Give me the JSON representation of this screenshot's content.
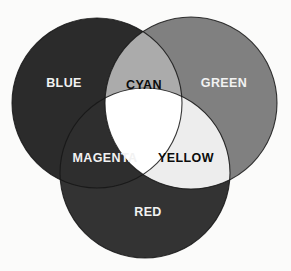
{
  "diagram": {
    "background_color": "#fbfbfa",
    "width": 291,
    "height": 271,
    "type": "venn-3-circle"
  },
  "circles": [
    {
      "id": "blue",
      "label": "BLUE",
      "cx": 97,
      "cy": 103,
      "r": 85,
      "fill": "#2b2b2b",
      "label_x": 64,
      "label_y": 84,
      "label_class": "label-light"
    },
    {
      "id": "green",
      "label": "GREEN",
      "cx": 191,
      "cy": 103,
      "r": 86,
      "fill": "#808080",
      "label_x": 224,
      "label_y": 84,
      "label_class": "label-light"
    },
    {
      "id": "red",
      "label": "RED",
      "cx": 145,
      "cy": 173,
      "r": 85,
      "fill": "#333333",
      "label_x": 148,
      "label_y": 213,
      "label_class": "label-light"
    }
  ],
  "intersections": [
    {
      "id": "cyan",
      "label": "CYAN",
      "parents": [
        "blue",
        "green"
      ],
      "fill": "#ababab",
      "label_x": 144,
      "label_y": 86,
      "label_class": "label-dark"
    },
    {
      "id": "magenta",
      "label": "MAGENTA",
      "parents": [
        "blue",
        "red"
      ],
      "fill": "#2e2e2e",
      "label_x": 105,
      "label_y": 159,
      "label_class": "label-light"
    },
    {
      "id": "yellow",
      "label": "YELLOW",
      "parents": [
        "green",
        "red"
      ],
      "fill": "#ededed",
      "label_x": 186,
      "label_y": 159,
      "label_class": "label-dark"
    }
  ],
  "center": {
    "id": "white",
    "label": "",
    "parents": [
      "blue",
      "green",
      "red"
    ],
    "fill": "#ffffff"
  },
  "chart_data": {
    "type": "venn",
    "sets": [
      "BLUE",
      "GREEN",
      "RED"
    ],
    "regions": [
      {
        "name": "BLUE",
        "members": [
          "blue"
        ],
        "shade": "#2b2b2b"
      },
      {
        "name": "GREEN",
        "members": [
          "green"
        ],
        "shade": "#808080"
      },
      {
        "name": "RED",
        "members": [
          "red"
        ],
        "shade": "#333333"
      },
      {
        "name": "CYAN",
        "members": [
          "blue",
          "green"
        ],
        "shade": "#ababab"
      },
      {
        "name": "MAGENTA",
        "members": [
          "blue",
          "red"
        ],
        "shade": "#2e2e2e"
      },
      {
        "name": "YELLOW",
        "members": [
          "green",
          "red"
        ],
        "shade": "#ededed"
      },
      {
        "name": "WHITE",
        "members": [
          "blue",
          "green",
          "red"
        ],
        "shade": "#ffffff"
      }
    ],
    "legend": "none",
    "grid": false
  }
}
